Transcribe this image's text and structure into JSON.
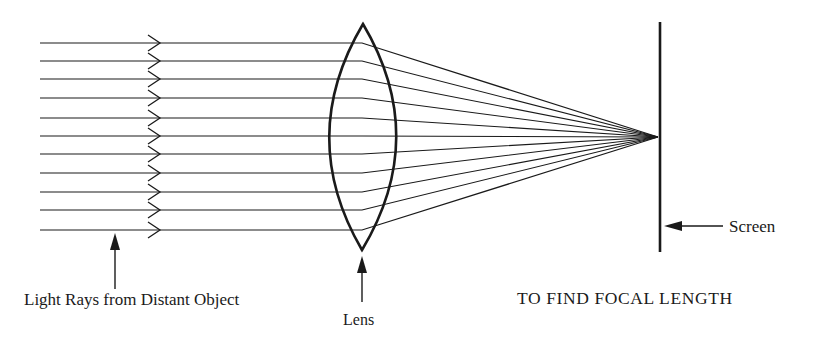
{
  "title": "TO FIND FOCAL LENGTH",
  "labels": {
    "light_rays": "Light Rays from Distant Object",
    "lens": "Lens",
    "screen": "Screen"
  },
  "colors": {
    "stroke": "#1a1a1a",
    "background": "#ffffff"
  },
  "geometry": {
    "ray_start_x": 40,
    "chevron_x": 160,
    "lens_x": 362,
    "ray_y": [
      43,
      61,
      79,
      98,
      118,
      136,
      154,
      173,
      192,
      210,
      230
    ],
    "focal_point": [
      658,
      137
    ],
    "screen": {
      "x": 660,
      "y1": 22,
      "y2": 252
    },
    "lens": {
      "top": [
        363,
        24
      ],
      "bottom": [
        362,
        250
      ],
      "left_x": 330,
      "right_x": 398
    }
  }
}
